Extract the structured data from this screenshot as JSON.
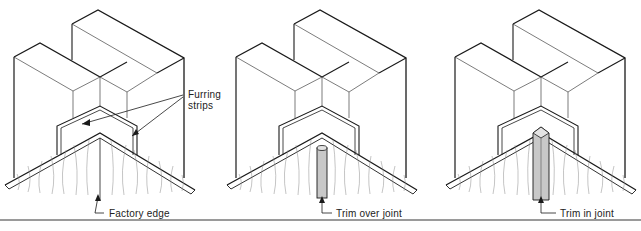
{
  "figure": {
    "panels": [
      {
        "id": "factory-edge",
        "label": "Factory edge",
        "callout": "Furring strips"
      },
      {
        "id": "trim-over-joint",
        "label": "Trim over joint"
      },
      {
        "id": "trim-in-joint",
        "label": "Trim in joint"
      }
    ],
    "furring_label_line1": "Furring",
    "furring_label_line2": "strips",
    "colors": {
      "line": "#1a1a1a",
      "trim": "#c8c8c8",
      "grain": "#8a8a8a",
      "rule": "#9a9a9a"
    }
  }
}
